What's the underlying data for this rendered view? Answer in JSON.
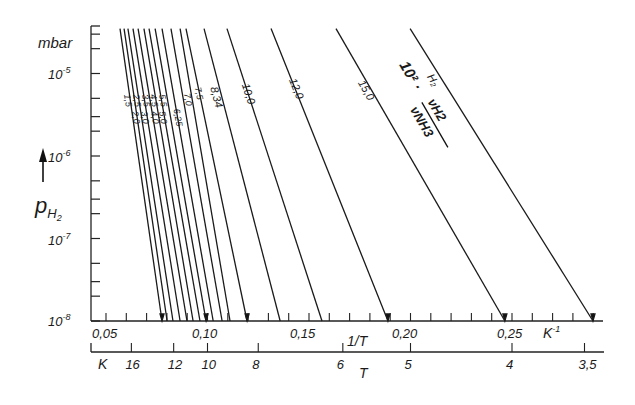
{
  "chart_data": {
    "type": "line",
    "title": "",
    "xlabel": "1/T",
    "x_unit": "K⁻¹",
    "secondary_xlabel": "T",
    "secondary_x_unit": "K",
    "ylabel": "p_H2",
    "y_unit": "mbar",
    "yscale": "log",
    "ylim": [
      1e-08,
      3.5e-05
    ],
    "xlim": [
      0.043,
      0.297
    ],
    "grid": false,
    "legend": "inline labels on lines",
    "x_ticks": [
      "0,05",
      "0,10",
      "0,15",
      "0,20",
      "0,25"
    ],
    "x_tick_values": [
      0.05,
      0.1,
      0.15,
      0.2,
      0.25
    ],
    "x_minor_step": 0.01,
    "secondary_x_ticks": [
      "16",
      "12",
      "10",
      "8",
      "6",
      "5",
      "4",
      "3,5"
    ],
    "secondary_x_tick_values": [
      16,
      12,
      10,
      8,
      6,
      5,
      4,
      3.5
    ],
    "y_ticks": [
      "10⁻⁵",
      "10⁻⁶",
      "10⁻⁷",
      "10⁻⁸"
    ],
    "y_tick_values": [
      1e-05,
      1e-06,
      1e-07,
      1e-08
    ],
    "annotation": "10² · νH2 / νNH3",
    "series": [
      {
        "name": "1,5",
        "x": [
          0.0569,
          0.0776
        ],
        "y": [
          3.5e-05,
          1e-08
        ]
      },
      {
        "name": "2,0",
        "x": [
          0.0589,
          0.0801
        ],
        "y": [
          3.5e-05,
          1e-08
        ]
      },
      {
        "name": "2,5",
        "x": [
          0.0608,
          0.083
        ],
        "y": [
          3.5e-05,
          1e-08
        ]
      },
      {
        "name": "3,0",
        "x": [
          0.0633,
          0.0865
        ],
        "y": [
          3.5e-05,
          1e-08
        ]
      },
      {
        "name": "3,5",
        "x": [
          0.0658,
          0.0899
        ],
        "y": [
          3.5e-05,
          1e-08
        ]
      },
      {
        "name": "4,0",
        "x": [
          0.0687,
          0.0929
        ],
        "y": [
          3.5e-05,
          1e-08
        ]
      },
      {
        "name": "4,5",
        "x": [
          0.0712,
          0.0963
        ],
        "y": [
          3.5e-05,
          1e-08
        ]
      },
      {
        "name": "5,0",
        "x": [
          0.0742,
          0.0993
        ],
        "y": [
          3.5e-05,
          1e-08
        ]
      },
      {
        "name": "5,5",
        "x": [
          0.0776,
          0.1028
        ],
        "y": [
          3.5e-05,
          1e-08
        ]
      },
      {
        "name": "6,25",
        "x": [
          0.082,
          0.1072
        ],
        "y": [
          3.5e-05,
          1e-08
        ]
      },
      {
        "name": "7,0",
        "x": [
          0.0865,
          0.1111
        ],
        "y": [
          3.5e-05,
          1e-08
        ]
      },
      {
        "name": "7,5",
        "x": [
          0.0894,
          0.1195
        ],
        "y": [
          3.5e-05,
          1e-08
        ]
      },
      {
        "name": "8,34",
        "x": [
          0.0983,
          0.1358
        ],
        "y": [
          3.5e-05,
          1e-08
        ]
      },
      {
        "name": "10,0",
        "x": [
          0.1096,
          0.1564
        ],
        "y": [
          3.5e-05,
          1e-08
        ]
      },
      {
        "name": "12,0",
        "x": [
          0.1313,
          0.1889
        ],
        "y": [
          3.5e-05,
          1e-08
        ]
      },
      {
        "name": "15,0",
        "x": [
          0.1633,
          0.2465
        ],
        "y": [
          3.5e-05,
          1e-08
        ]
      },
      {
        "name": "H2",
        "x": [
          0.1998,
          0.2899
        ],
        "y": [
          3.5e-05,
          1e-08
        ]
      }
    ]
  },
  "labels": {
    "y_unit": "mbar",
    "y_axis_symbol": "p",
    "y_axis_subscript": "H",
    "y_axis_subsubscript": "2",
    "y_ticks": [
      "10",
      "10",
      "10",
      "10"
    ],
    "y_exps": [
      "-5",
      "-6",
      "-7",
      "-8"
    ],
    "x_ticks": [
      "0,05",
      "0,10",
      "0,15",
      "0,20",
      "0,25"
    ],
    "x_unit": "K",
    "x_unit_exp": "-1",
    "x_axis_title": "1/T",
    "t_axis_unit": "K",
    "t_axis_title": "T",
    "t_ticks": [
      "16",
      "12",
      "10",
      "8",
      "6",
      "5",
      "4",
      "3,5"
    ],
    "line_labels": [
      "1,5",
      "2,0",
      "2,5",
      "3,0",
      "3,5",
      "4,0",
      "4,5",
      "5,0",
      "5,5",
      "6,25",
      "7,0",
      "7,5",
      "8,34",
      "10,0",
      "12,0",
      "15,0",
      "H₂"
    ],
    "annotation_prefix": "10² ·",
    "annotation_num": "νH2",
    "annotation_den": "νNH3"
  }
}
